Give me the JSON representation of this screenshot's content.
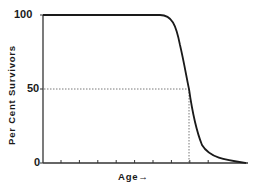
{
  "chart_data": {
    "type": "line",
    "title": "",
    "xlabel": "Age",
    "xlabel_arrow": "→",
    "ylabel": "Per Cent Survivors",
    "yticks": [
      0,
      50,
      100
    ],
    "ytick_labels": [
      "0",
      "50",
      "100"
    ],
    "ylim": [
      0,
      100
    ],
    "xlim": [
      0,
      11
    ],
    "x_tick_count": 9,
    "x_tick_labels": [],
    "grid": false,
    "legend": null,
    "series": [
      {
        "name": "Survivorship curve",
        "color": "#1a1a1a",
        "x": [
          0,
          1,
          2,
          3,
          4,
          5,
          6,
          6.5,
          7,
          7.5,
          8,
          8.5,
          9,
          9.5,
          10,
          10.5,
          11
        ],
        "values": [
          100,
          100,
          100,
          100,
          100,
          100,
          100,
          99,
          94,
          83,
          68,
          50,
          28,
          13,
          6,
          2,
          0
        ]
      }
    ],
    "annotations": [
      {
        "type": "dotted-horizontal",
        "y": 50,
        "x_from": 0,
        "x_to": 8.5
      },
      {
        "type": "dotted-vertical",
        "x": 8.5,
        "y_from": 0,
        "y_to": 50
      }
    ]
  },
  "labels": {
    "y100": "100",
    "y50": "50",
    "y0": "0",
    "ylabel": "Per Cent Survivors",
    "xlabel": "Age→"
  },
  "colors": {
    "axis": "#333333",
    "curve": "#1a1a1a",
    "guide": "#555555"
  }
}
